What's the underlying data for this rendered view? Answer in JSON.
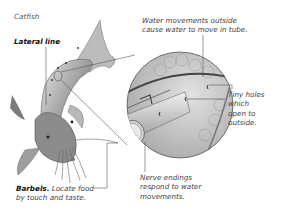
{
  "title": "Catfish",
  "labels": {
    "lateral_line": "Lateral line",
    "water_movements": [
      "Water movements outside",
      "cause water to move in tube."
    ],
    "tiny_holes": [
      "Tiny holes",
      "which",
      "open to",
      "outside."
    ],
    "barbels_title": "Barbels.",
    "barbels_desc": [
      "Locate food",
      "by touch and taste."
    ],
    "nerve_endings": [
      "Nerve endings",
      "respond to water",
      "movements."
    ]
  },
  "colors": {
    "fish_body": "#8a8a8a",
    "fish_light": "#d8d8d8",
    "tube": "#bdbdbd",
    "circle_outline": "#555555",
    "leader_line": "#555555",
    "text": "#444444"
  }
}
